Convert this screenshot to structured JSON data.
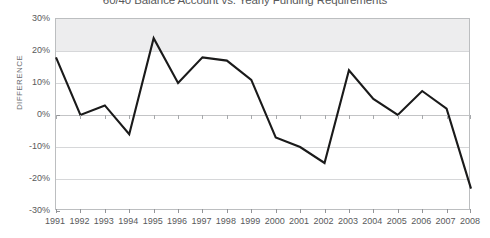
{
  "chart_data": {
    "type": "line",
    "title": "60/40 Balance Account vs. Yearly Funding Requirements",
    "xlabel": "",
    "ylabel": "DIFFERENCE",
    "categories": [
      "1991",
      "1992",
      "1993",
      "1994",
      "1995",
      "1996",
      "1997",
      "1998",
      "1999",
      "2000",
      "2001",
      "2002",
      "2003",
      "2004",
      "2005",
      "2006",
      "2007",
      "2008"
    ],
    "values": [
      18,
      0,
      3,
      -6,
      24,
      10,
      18,
      17,
      11,
      -7,
      -10,
      -15,
      14,
      5,
      0,
      7.5,
      2,
      -23
    ],
    "series": [
      {
        "name": "Difference",
        "values": [
          18,
          0,
          3,
          -6,
          24,
          10,
          18,
          17,
          11,
          -7,
          -10,
          -15,
          14,
          5,
          0,
          7.5,
          2,
          -23
        ]
      }
    ],
    "ylim": [
      -30,
      30
    ],
    "ytick_step": 10,
    "ytick_labels": [
      "30%",
      "20%",
      "10%",
      "0%",
      "-10%",
      "-20%",
      "-30%"
    ],
    "ytick_values": [
      30,
      20,
      10,
      0,
      -10,
      -20,
      -30
    ],
    "unit": "%",
    "grid": true,
    "legend_position": "none",
    "shaded_band": {
      "from": 20,
      "to": 30,
      "color": "#ededee"
    },
    "line_color": "#1a1a1a",
    "markers": false,
    "title_clipped_top": true
  },
  "axis_colors": {
    "frame": "#bcbec0",
    "gridline": "#d6d7d9",
    "tick": "#939598",
    "text": "#58595b"
  }
}
